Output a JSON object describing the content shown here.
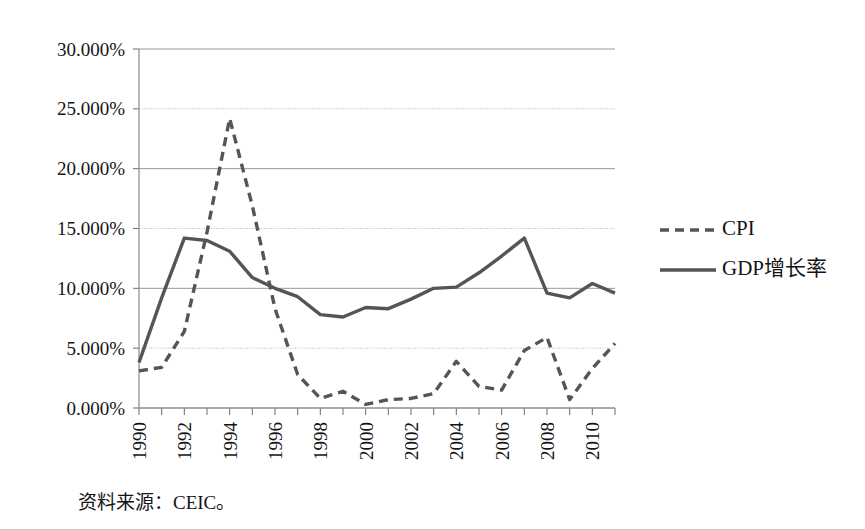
{
  "figure": {
    "source_note": "资料来源：CEIC。"
  },
  "legend": {
    "position": "right",
    "entries": [
      {
        "label": "CPI",
        "style": "dashed",
        "color": "#555555"
      },
      {
        "label": "GDP增长率",
        "style": "solid",
        "color": "#555555"
      }
    ]
  },
  "axes": {
    "y_ticks": [
      "0.000%",
      "5.000%",
      "10.000%",
      "15.000%",
      "20.000%",
      "25.000%",
      "30.000%"
    ],
    "x_ticks": [
      "1990",
      "1992",
      "1994",
      "1996",
      "1998",
      "2000",
      "2002",
      "2004",
      "2006",
      "2008",
      "2010"
    ]
  },
  "chart_data": {
    "type": "line",
    "title": "",
    "xlabel": "",
    "ylabel": "",
    "xlim": [
      1990,
      2011
    ],
    "ylim": [
      0,
      30
    ],
    "y_unit": "percent",
    "grid": true,
    "legend_position": "right",
    "x": [
      1990,
      1991,
      1992,
      1993,
      1994,
      1995,
      1996,
      1997,
      1998,
      1999,
      2000,
      2001,
      2002,
      2003,
      2004,
      2005,
      2006,
      2007,
      2008,
      2009,
      2010,
      2011
    ],
    "series": [
      {
        "name": "CPI",
        "style": "dashed",
        "color": "#555555",
        "values": [
          3.1,
          3.4,
          6.4,
          14.7,
          24.2,
          16.9,
          8.3,
          2.8,
          0.8,
          1.4,
          0.3,
          0.7,
          0.8,
          1.2,
          3.9,
          1.8,
          1.5,
          4.8,
          5.9,
          0.7,
          3.3,
          5.4
        ]
      },
      {
        "name": "GDP增长率",
        "style": "solid",
        "color": "#555555",
        "values": [
          3.8,
          9.2,
          14.2,
          14.0,
          13.1,
          10.9,
          10.0,
          9.3,
          7.8,
          7.6,
          8.4,
          8.3,
          9.1,
          10.0,
          10.1,
          11.3,
          12.7,
          14.2,
          9.6,
          9.2,
          10.4,
          9.6
        ]
      }
    ]
  }
}
